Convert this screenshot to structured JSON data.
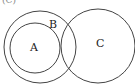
{
  "diagram": {
    "type": "venn",
    "top_fragment": "(C)",
    "circles": [
      {
        "id": "B",
        "label": "B",
        "cx": 40,
        "cy": 47,
        "r": 36
      },
      {
        "id": "A",
        "label": "A",
        "cx": 35,
        "cy": 48,
        "r": 25
      },
      {
        "id": "C",
        "label": "C",
        "cx": 98,
        "cy": 46,
        "r": 37
      }
    ],
    "labels": {
      "A": "A",
      "B": "B",
      "C": "C"
    },
    "stroke_color": "#444444"
  }
}
